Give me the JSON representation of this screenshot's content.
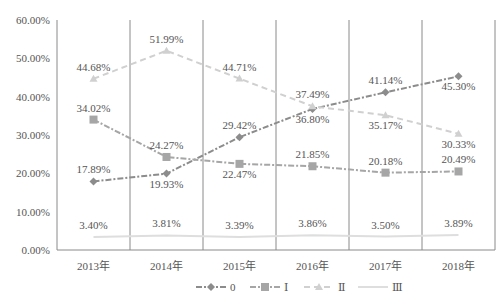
{
  "chart_data": {
    "type": "line",
    "title": "",
    "xlabel": "",
    "ylabel": "",
    "categories": [
      "2013年",
      "2014年",
      "2015年",
      "2016年",
      "2017年",
      "2018年"
    ],
    "ylim": [
      0,
      60
    ],
    "yticks": [
      "0.00%",
      "10.00%",
      "20.00%",
      "30.00%",
      "40.00%",
      "50.00%",
      "60.00%"
    ],
    "grid": "vertical lines between categories",
    "legend_position": "bottom",
    "series": [
      {
        "name": "0",
        "values": [
          17.89,
          19.93,
          29.42,
          36.8,
          41.14,
          45.3
        ],
        "labels": [
          "17.89%",
          "19.93%",
          "29.42%",
          "36.80%",
          "41.14%",
          "45.30%"
        ],
        "color": "#8c8c8c",
        "marker": "diamond",
        "dash": "6,2,2,2"
      },
      {
        "name": "Ⅰ",
        "values": [
          34.02,
          24.27,
          22.47,
          21.85,
          20.18,
          20.49
        ],
        "labels": [
          "34.02%",
          "24.27%",
          "22.47%",
          "21.85%",
          "20.18%",
          "20.49%"
        ],
        "color": "#a6a6a6",
        "marker": "square",
        "dash": "6,2,2,2"
      },
      {
        "name": "Ⅱ",
        "values": [
          44.68,
          51.99,
          44.71,
          37.49,
          35.17,
          30.33
        ],
        "labels": [
          "44.68%",
          "51.99%",
          "44.71%",
          "37.49%",
          "35.17%",
          "30.33%"
        ],
        "color": "#d0d0d0",
        "marker": "triangle",
        "dash": "6,4"
      },
      {
        "name": "Ⅲ",
        "values": [
          3.4,
          3.81,
          3.39,
          3.86,
          3.5,
          3.89
        ],
        "labels": [
          "3.40%",
          "3.81%",
          "3.39%",
          "3.86%",
          "3.50%",
          "3.89%"
        ],
        "color": "#dedede",
        "marker": "none",
        "dash": ""
      }
    ]
  }
}
